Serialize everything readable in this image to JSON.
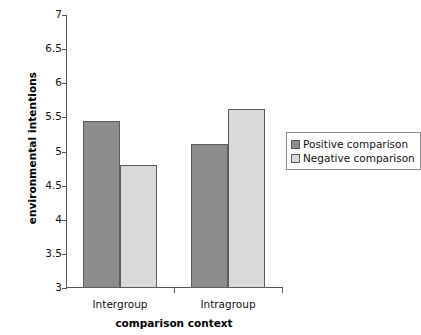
{
  "chart_data": {
    "type": "bar",
    "title": "",
    "xlabel": "comparison context",
    "ylabel": "environmental intentions",
    "categories": [
      "Intergroup",
      "Intragroup"
    ],
    "series": [
      {
        "name": "Positive comparison",
        "values": [
          5.45,
          5.11
        ],
        "color": "#8c8c8c"
      },
      {
        "name": "Negative comparison",
        "values": [
          4.8,
          5.63
        ],
        "color": "#d9d9d9"
      }
    ],
    "ylim": [
      3,
      7
    ],
    "ytick_labels": [
      "3",
      "3.5",
      "4",
      "4.5",
      "5",
      "5.5",
      "6",
      "6.5",
      "7"
    ],
    "ytick_values": [
      3,
      3.5,
      4,
      4.5,
      5,
      5.5,
      6,
      6.5,
      7
    ],
    "grid": false,
    "legend_position": "right"
  },
  "legend": {
    "entries": [
      {
        "label": "Positive comparison"
      },
      {
        "label": "Negative comparison"
      }
    ]
  },
  "colors": {
    "positive_bar": "#8c8c8c",
    "negative_bar": "#d9d9d9",
    "bar_border": "#5c5c5c",
    "axis": "#555555",
    "text": "#111111",
    "background": "#ffffff"
  }
}
